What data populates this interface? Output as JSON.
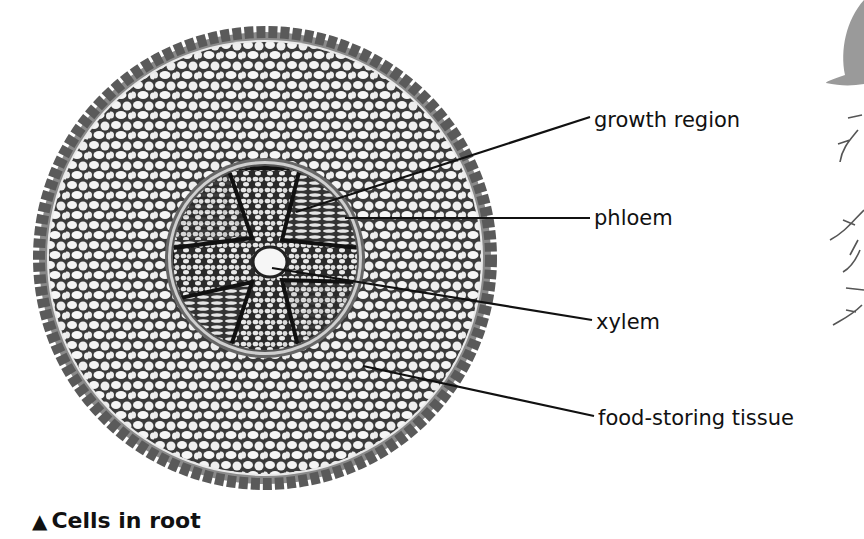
{
  "diagram": {
    "labels": [
      {
        "id": "growth",
        "text": "growth region",
        "x": 594,
        "y": 112,
        "line": {
          "x1": 296,
          "y1": 212,
          "x2": 590,
          "y2": 117
        }
      },
      {
        "id": "phloem",
        "text": "phloem",
        "x": 594,
        "y": 210,
        "line": {
          "x1": 345,
          "y1": 218,
          "x2": 590,
          "y2": 218
        }
      },
      {
        "id": "xylem",
        "text": "xylem",
        "x": 596,
        "y": 313,
        "line": {
          "x1": 272,
          "y1": 268,
          "x2": 592,
          "y2": 320
        }
      },
      {
        "id": "food",
        "text": "food-storing tissue",
        "x": 598,
        "y": 410,
        "line": {
          "x1": 363,
          "y1": 366,
          "x2": 594,
          "y2": 416
        }
      }
    ]
  },
  "caption": {
    "marker": "▲",
    "text": "Cells in root"
  },
  "colors": {
    "ink": "#111111",
    "cell_fill": "#f2f2f2",
    "cell_wall": "#3a3a3a",
    "epidermis": "#8a8a8a",
    "background": "#ffffff"
  }
}
